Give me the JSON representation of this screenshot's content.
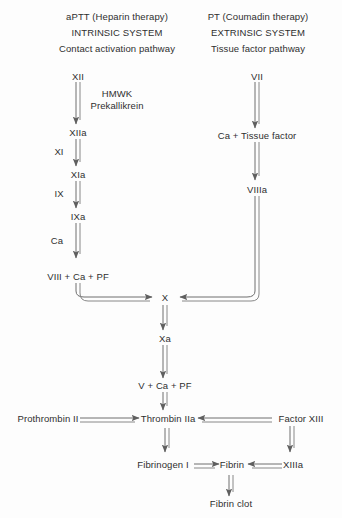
{
  "figure": {
    "background_color": "#fdfdfd",
    "line_color": "#6e6e6e",
    "text_color": "#2f2f2f"
  },
  "headers": {
    "intrinsic": {
      "test": "aPTT (Heparin therapy)",
      "system": "INTRINSIC SYSTEM",
      "pathway": "Contact activation pathway"
    },
    "extrinsic": {
      "test": "PT (Coumadin therapy)",
      "system": "EXTRINSIC SYSTEM",
      "pathway": "Tissue factor pathway"
    }
  },
  "intrinsic_pathway": {
    "nodes": [
      "XII",
      "XIIa",
      "XIa",
      "IXa",
      "VIII + Ca + PF"
    ],
    "cofactors": [
      "HMWK",
      "Prekallikrein"
    ],
    "side_labels": [
      "XI",
      "IX",
      "Ca"
    ]
  },
  "extrinsic_pathway": {
    "nodes": [
      "VII",
      "Ca + Tissue factor",
      "VIIIa"
    ]
  },
  "common_pathway": {
    "nodes": [
      "X",
      "Xa",
      "V + Ca + PF",
      "Thrombin IIa",
      "Fibrinogen I",
      "Fibrin",
      "Fibrin clot"
    ],
    "left_input": "Prothrombin II",
    "right_input": "Factor XIII",
    "right_activated": "XIIIa"
  },
  "caption": ""
}
